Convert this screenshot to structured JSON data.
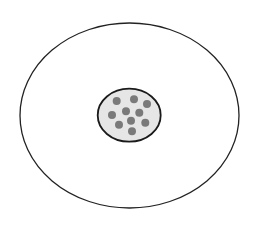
{
  "diagram": {
    "canvas": {
      "width": 259,
      "height": 230,
      "background": "#ffffff"
    },
    "outer_ellipse": {
      "cx": 129.5,
      "cy": 115.5,
      "rx": 109.5,
      "ry": 92.5,
      "fill": "#ffffff",
      "stroke": "#222222",
      "stroke_width": 1.3
    },
    "inner_ellipse": {
      "cx": 129.2,
      "cy": 115.2,
      "rx": 31.5,
      "ry": 26.5,
      "fill": "#e6e6e6",
      "stroke": "#1a1a1a",
      "stroke_width": 1.8
    },
    "dots": {
      "color": "#7a7a7a",
      "radius": 4,
      "points": [
        {
          "x": 116.7,
          "y": 101
        },
        {
          "x": 134,
          "y": 99.3
        },
        {
          "x": 147,
          "y": 104
        },
        {
          "x": 126,
          "y": 111.3
        },
        {
          "x": 139.3,
          "y": 112.7
        },
        {
          "x": 112,
          "y": 115
        },
        {
          "x": 131,
          "y": 120.7
        },
        {
          "x": 119,
          "y": 124.7
        },
        {
          "x": 145.3,
          "y": 122.7
        },
        {
          "x": 132,
          "y": 131.3
        }
      ]
    }
  }
}
